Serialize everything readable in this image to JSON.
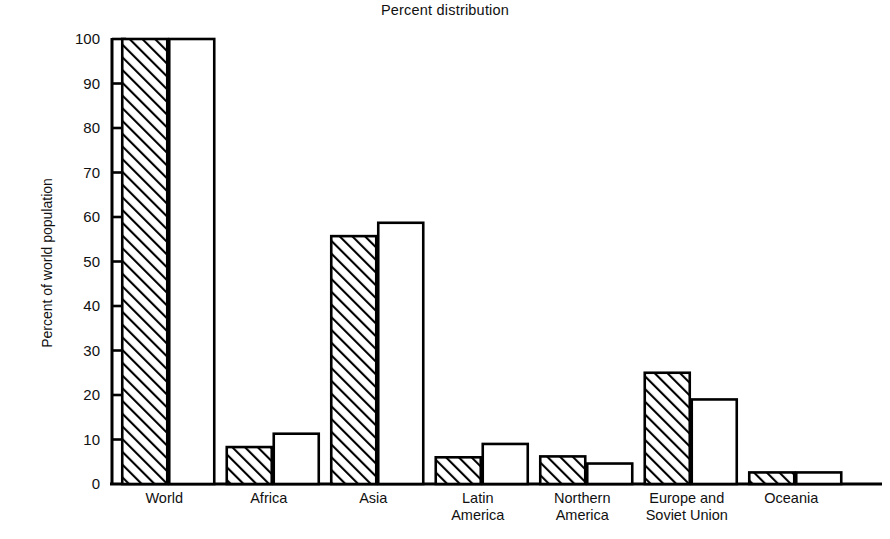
{
  "chart_data": {
    "type": "bar",
    "title": "Percent distribution",
    "xlabel": "",
    "ylabel": "Percent of world population",
    "ylim": [
      0,
      100
    ],
    "yticks": [
      0,
      10,
      20,
      30,
      40,
      50,
      60,
      70,
      80,
      90,
      100
    ],
    "ytick_labels": [
      "0",
      "10",
      "20",
      "30",
      "40",
      "50",
      "60",
      "70",
      "80",
      "90",
      "100"
    ],
    "grid": false,
    "legend": "none",
    "categories": [
      "World",
      "Africa",
      "Asia",
      "Latin\nAmerica",
      "Northern\nAmerica",
      "Europe and\nSoviet Union",
      "Oceania"
    ],
    "series": [
      {
        "name": "hatched",
        "fill": "diagonal-hatch",
        "values": [
          100,
          8.3,
          55.7,
          6.0,
          6.2,
          25.0,
          2.6
        ]
      },
      {
        "name": "open",
        "fill": "white",
        "values": [
          100,
          11.3,
          58.7,
          9.0,
          4.6,
          19.0,
          2.6
        ]
      }
    ],
    "colors": {
      "stroke": "#000000",
      "hatch": "#000000",
      "open_fill": "#ffffff",
      "background": "#ffffff"
    }
  },
  "geometry": {
    "plot_left": 112,
    "plot_right": 874,
    "plot_top": 39,
    "plot_bottom": 484,
    "axis_x": 112,
    "group_width": 104.5,
    "bar_width": 45,
    "bar_gap": 2
  }
}
